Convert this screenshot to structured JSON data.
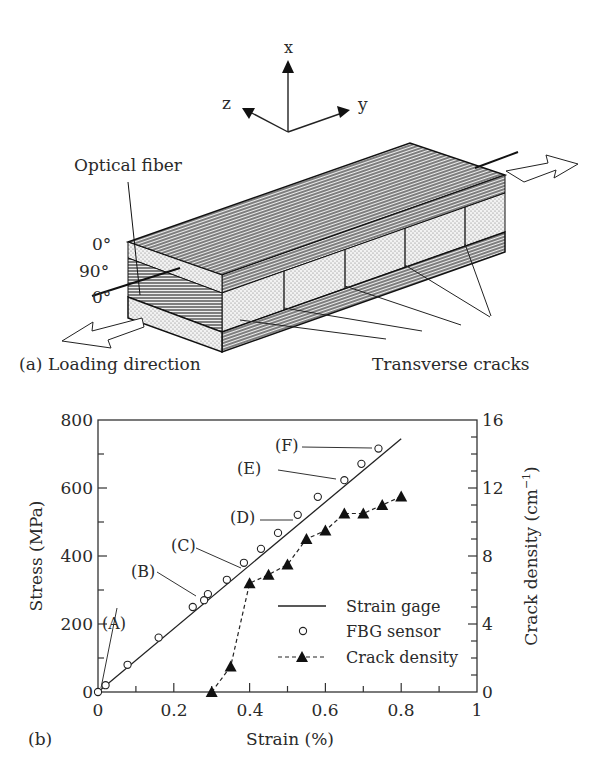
{
  "figure_a": {
    "panel_label": "(a)",
    "axes": {
      "x": "x",
      "y": "y",
      "z": "z"
    },
    "ply_labels": [
      "0°",
      "90°",
      "0°"
    ],
    "optical_fiber_label": "Optical fiber",
    "loading_label": "Loading direction",
    "cracks_label": "Transverse cracks"
  },
  "figure_b": {
    "panel_label": "(b)",
    "xlabel": "Strain (%)",
    "ylabel_left": "Stress (MPa)",
    "ylabel_right": "Crack density (cm",
    "ylabel_right_sup": "−1",
    "ylabel_right_close": ")",
    "x_ticks": [
      "0",
      "0.2",
      "0.4",
      "0.6",
      "0.8",
      "1"
    ],
    "y_left_ticks": [
      "0",
      "200",
      "400",
      "600",
      "800"
    ],
    "y_right_ticks": [
      "0",
      "4",
      "8",
      "12",
      "16"
    ],
    "annotations": [
      "(A)",
      "(B)",
      "(C)",
      "(D)",
      "(E)",
      "(F)"
    ],
    "legend": {
      "strain_gage": "Strain gage",
      "fbg_sensor": "FBG sensor",
      "crack_density": "Crack density"
    }
  },
  "chart_data": {
    "type": "scatter",
    "title": "",
    "xlabel": "Strain (%)",
    "ylabel": "Stress (MPa)",
    "y2label": "Crack density (cm^-1)",
    "xlim": [
      0,
      1
    ],
    "ylim": [
      0,
      800
    ],
    "y2lim": [
      0,
      16
    ],
    "grid": false,
    "legend_position": "lower right",
    "series": [
      {
        "name": "Strain gage",
        "type": "line",
        "style": "solid",
        "axis": "left",
        "x": [
          0,
          0.8
        ],
        "y": [
          0,
          745
        ]
      },
      {
        "name": "FBG sensor",
        "type": "scatter",
        "marker": "open-circle",
        "axis": "left",
        "x": [
          0,
          0.02,
          0.078,
          0.16,
          0.25,
          0.28,
          0.29,
          0.34,
          0.385,
          0.43,
          0.475,
          0.527,
          0.58,
          0.65,
          0.695,
          0.74
        ],
        "y": [
          0,
          20,
          80,
          160,
          250,
          270,
          288,
          330,
          380,
          421,
          468,
          521,
          574,
          623,
          671,
          716
        ]
      },
      {
        "name": "Crack density",
        "type": "line",
        "style": "dashed",
        "marker": "filled-triangle",
        "axis": "right",
        "x": [
          0.3,
          0.35,
          0.4,
          0.45,
          0.5,
          0.55,
          0.6,
          0.65,
          0.7,
          0.75,
          0.8
        ],
        "y": [
          0,
          1.5,
          6.4,
          6.9,
          7.5,
          9.0,
          9.5,
          10.5,
          10.5,
          11.0,
          11.5
        ]
      }
    ],
    "annotations": [
      {
        "label": "(A)",
        "x": 0.02,
        "y": 20
      },
      {
        "label": "(B)",
        "x": 0.28,
        "y": 270
      },
      {
        "label": "(C)",
        "x": 0.385,
        "y": 380
      },
      {
        "label": "(D)",
        "x": 0.527,
        "y": 521
      },
      {
        "label": "(E)",
        "x": 0.65,
        "y": 623
      },
      {
        "label": "(F)",
        "x": 0.74,
        "y": 716
      }
    ]
  }
}
